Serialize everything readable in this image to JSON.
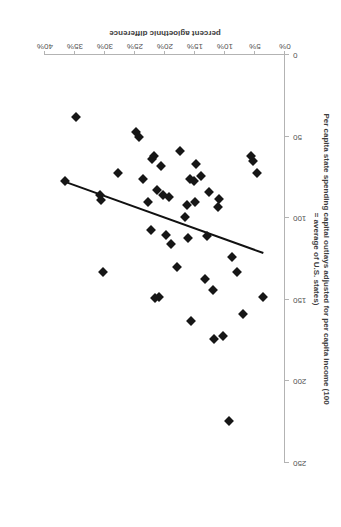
{
  "chart_data": {
    "type": "scatter",
    "title": "",
    "subtitle": "",
    "xlabel": "percent agioethnic difference",
    "ylabel": "Per capita state spending capital outlays adjusted for per capita income (100 = average of U.S. states)",
    "ylabel_line1": "Per capita state spending capital outlays adjusted for per capita income (100",
    "ylabel_line2": "= average of U.S. states)",
    "xlim": [
      0,
      40
    ],
    "ylim": [
      0,
      250
    ],
    "xticks": [
      "0%",
      "5%",
      "10%",
      "15%",
      "20%",
      "25%",
      "30%",
      "35%",
      "40%"
    ],
    "xtick_values": [
      0,
      5,
      10,
      15,
      20,
      25,
      30,
      35,
      40
    ],
    "yticks": [
      "0",
      "50",
      "100",
      "150",
      "200",
      "250"
    ],
    "ytick_values": [
      0,
      50,
      100,
      150,
      200,
      250
    ],
    "grid": false,
    "legend": false,
    "legend_position": "none",
    "marker_style": "diamond",
    "marker_color": "#161616",
    "axis_color": "#b3b3b3",
    "rotation_degrees": 180,
    "series": [
      {
        "name": "states",
        "points": [
          [
            3.6,
            148
          ],
          [
            4.6,
            72
          ],
          [
            5.3,
            65
          ],
          [
            5.6,
            62
          ],
          [
            7.0,
            159
          ],
          [
            8.0,
            133
          ],
          [
            8.8,
            124
          ],
          [
            9.3,
            224
          ],
          [
            10.4,
            172
          ],
          [
            11.0,
            88
          ],
          [
            11.2,
            93
          ],
          [
            11.9,
            174
          ],
          [
            12.0,
            144
          ],
          [
            12.6,
            84
          ],
          [
            13.0,
            111
          ],
          [
            13.4,
            137
          ],
          [
            14.0,
            74
          ],
          [
            14.8,
            67
          ],
          [
            15.0,
            90
          ],
          [
            15.2,
            77
          ],
          [
            15.6,
            163
          ],
          [
            15.8,
            76
          ],
          [
            16.1,
            112
          ],
          [
            16.3,
            92
          ],
          [
            16.6,
            99
          ],
          [
            17.5,
            59
          ],
          [
            18.0,
            130
          ],
          [
            19.0,
            116
          ],
          [
            19.4,
            87
          ],
          [
            19.8,
            110
          ],
          [
            20.3,
            86
          ],
          [
            20.6,
            68
          ],
          [
            21.0,
            148
          ],
          [
            21.4,
            83
          ],
          [
            21.6,
            149
          ],
          [
            21.9,
            62
          ],
          [
            22.1,
            64
          ],
          [
            22.4,
            107
          ],
          [
            22.9,
            90
          ],
          [
            23.6,
            76
          ],
          [
            24.4,
            50
          ],
          [
            24.9,
            47
          ],
          [
            27.8,
            72
          ],
          [
            30.3,
            133
          ],
          [
            30.6,
            89
          ],
          [
            30.9,
            86
          ],
          [
            34.9,
            38
          ],
          [
            36.6,
            77
          ]
        ]
      }
    ],
    "trend_line": {
      "type": "linear",
      "color": "#111111",
      "x_start": 3.6,
      "y_start": 122,
      "x_end": 36.9,
      "y_end": 78
    }
  }
}
